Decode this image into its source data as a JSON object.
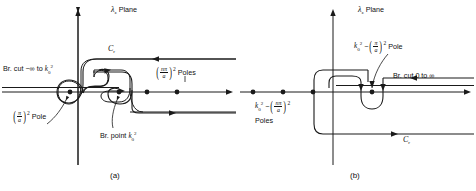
{
  "figure": {
    "type": "complex-plane-contour-diagram",
    "panel_count": 2,
    "stroke_color": "#1a1a1a"
  },
  "panel_a": {
    "caption": "(a)",
    "plane_title": {
      "symbol": "λ",
      "subscript": "z",
      "word": "Plane",
      "full": "λ_z Plane"
    },
    "contour_label": {
      "symbol": "C",
      "subscript": "r",
      "full": "C_r"
    },
    "branch_cut_label": {
      "prefix": "Br. cut",
      "range": "−∞ to",
      "k": "k",
      "k_sub": "0",
      "k_sup": "2",
      "full": "Br. cut −∞ to k₀²"
    },
    "poles_label": {
      "num": "nπ",
      "den": "a",
      "power": "2",
      "word": "Poles",
      "full": "(nπ/a)² Poles"
    },
    "pole_label": {
      "num": "π",
      "den": "a",
      "power": "2",
      "word": "Pole",
      "full": "(π/a)² Pole"
    },
    "branch_point_label": {
      "prefix": "Br. point",
      "k": "k",
      "k_sub": "0",
      "k_sup": "2",
      "full": "Br. point k₀²"
    },
    "poles_on_axis": [
      {
        "name": "pi-over-a-pole",
        "x": 70,
        "y": 92
      },
      {
        "name": "branch-point",
        "x": 119,
        "y": 92
      },
      {
        "name": "n-pi-over-a-pole-1",
        "x": 147,
        "y": 92
      },
      {
        "name": "n-pi-over-a-pole-2",
        "x": 177,
        "y": 92
      }
    ]
  },
  "panel_b": {
    "caption": "(b)",
    "plane_title": {
      "symbol": "λ",
      "subscript": "z",
      "word": "Plane",
      "full": "λ_z Plane"
    },
    "contour_label": {
      "symbol": "C",
      "subscript": "r",
      "full": "C_r"
    },
    "branch_cut_label": {
      "full": "Br. cut 0 to ∞",
      "prefix": "Br. cut",
      "range": "0 to ∞"
    },
    "pole_label": {
      "k": "k",
      "k_sub": "0",
      "k_sup": "2",
      "minus": "−",
      "num": "π",
      "den": "a",
      "power": "2",
      "word": "Pole",
      "full": "k₀² − (π/a)² Pole"
    },
    "poles_label": {
      "k": "k",
      "k_sub": "0",
      "k_sup": "2",
      "minus": "−",
      "num": "nπ",
      "den": "a",
      "power": "2",
      "word": "Poles",
      "full": "k₀² − (nπ/a)² Poles"
    },
    "poles_on_axis": [
      {
        "name": "pole-1",
        "x": 15,
        "y": 92
      },
      {
        "name": "pole-2",
        "x": 45,
        "y": 92
      },
      {
        "name": "pole-3",
        "x": 75,
        "y": 92
      },
      {
        "name": "main-pole",
        "x": 140,
        "y": 92
      }
    ]
  }
}
